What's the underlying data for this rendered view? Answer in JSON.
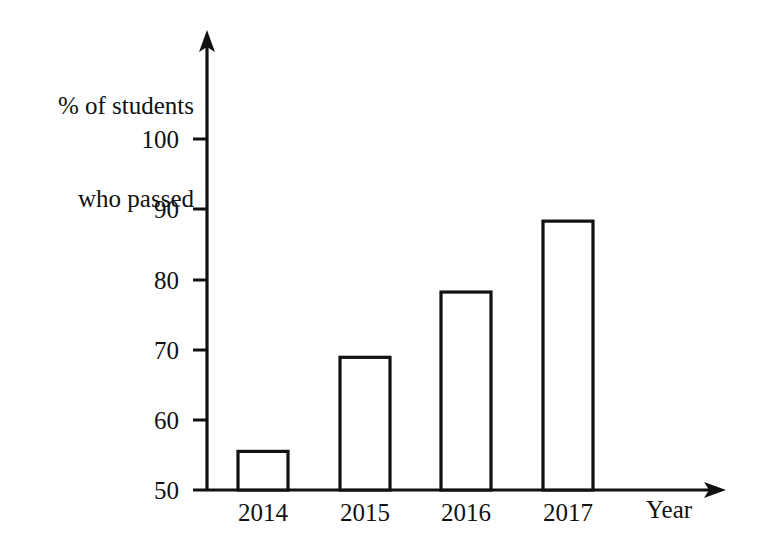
{
  "chart_data": {
    "type": "bar",
    "title": "",
    "subtitle": "",
    "categories": [
      "2014",
      "2015",
      "2016",
      "2017"
    ],
    "values": [
      55.5,
      68.9,
      78.2,
      88.3
    ],
    "xlabel": "Year",
    "ylabel": "% of students who passed",
    "ylabel_line1": "% of students",
    "ylabel_line2": "who passed",
    "ylim": [
      50,
      100
    ],
    "yticks": [
      50,
      60,
      70,
      80,
      90,
      100
    ],
    "ytick_labels": [
      "50",
      "60",
      "70",
      "80",
      "90",
      "100"
    ],
    "grid": false,
    "legend": "none",
    "bar_fill": "#ffffff",
    "bar_stroke": "#111111",
    "background": "#ffffff",
    "axis_color": "#111111",
    "axis_arrows": true
  },
  "labels": {
    "y_title_line1": "% of students",
    "y_title_line2": "who passed",
    "x_title": "Year",
    "y_tick_100": "100",
    "y_tick_90": "90",
    "y_tick_80": "80",
    "y_tick_70": "70",
    "y_tick_60": "60",
    "y_tick_50": "50",
    "cat_0": "2014",
    "cat_1": "2015",
    "cat_2": "2016",
    "cat_3": "2017"
  }
}
